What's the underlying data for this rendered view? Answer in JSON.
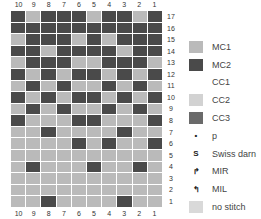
{
  "chart": {
    "columns": [
      "10",
      "9",
      "8",
      "7",
      "6",
      "5",
      "4",
      "3",
      "2",
      "1"
    ],
    "rows": [
      {
        "label": "17",
        "cells": "DLDDDLDDLD"
      },
      {
        "label": "16",
        "cells": "DDDDDDDDDD"
      },
      {
        "label": "15",
        "cells": "LDDDLDLDDD"
      },
      {
        "label": "14",
        "cells": "DDLDDDDLDD"
      },
      {
        "label": "13",
        "cells": "LDDDLLDDDL"
      },
      {
        "label": "12",
        "cells": "DLDLDDLDLD"
      },
      {
        "label": "11",
        "cells": "LDLDLLDLDL"
      },
      {
        "label": "10",
        "cells": "DLDLDDLDLD"
      },
      {
        "label": "9",
        "cells": "LDLDLLDLDL"
      },
      {
        "label": "8",
        "cells": "DLLLDDLLLD"
      },
      {
        "label": "7",
        "cells": "LLDLLLLDLL"
      },
      {
        "label": "6",
        "cells": "LLLLDLDLLD"
      },
      {
        "label": "5",
        "cells": "LLLLLLLLLL"
      },
      {
        "label": "4",
        "cells": "LDLLLDLLDL"
      },
      {
        "label": "3",
        "cells": "LLLLLLLLLL"
      },
      {
        "label": "2",
        "cells": "LLLLLLLLLL"
      },
      {
        "label": "1",
        "cells": "LLDLLLLDLL"
      }
    ],
    "colors": {
      "L": "#bababa",
      "D": "#4a4a4a"
    }
  },
  "legend": [
    {
      "label": "MC1",
      "color": "#bababa",
      "glyph": ""
    },
    {
      "label": "MC2",
      "color": "#4a4a4a",
      "glyph": ""
    },
    {
      "label": "CC1",
      "color": "#ffffff",
      "glyph": ""
    },
    {
      "label": "CC2",
      "color": "#d2d2d2",
      "glyph": ""
    },
    {
      "label": "CC3",
      "color": "#6a6a6a",
      "glyph": ""
    },
    {
      "label": "p",
      "color": "#ffffff",
      "glyph": "•"
    },
    {
      "label": "Swiss darn",
      "color": "#ffffff",
      "glyph": "S"
    },
    {
      "label": "MIR",
      "color": "#ffffff",
      "glyph": "↱"
    },
    {
      "label": "MIL",
      "color": "#ffffff",
      "glyph": "↰"
    },
    {
      "label": "no stitch",
      "color": "#d9d9d9",
      "glyph": ""
    }
  ]
}
